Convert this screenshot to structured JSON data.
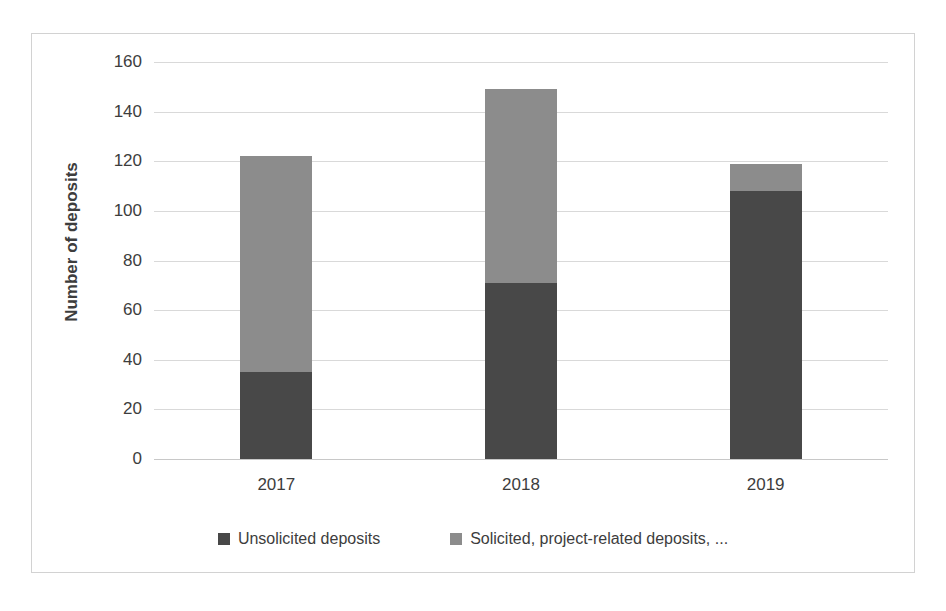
{
  "chart_data": {
    "type": "bar",
    "stacked": true,
    "title": "",
    "subtitle": "",
    "xlabel": "",
    "ylabel": "Number of deposits",
    "categories": [
      "2017",
      "2018",
      "2019"
    ],
    "series": [
      {
        "name": "Unsolicited deposits",
        "color": "#484848",
        "values": [
          35,
          71,
          108
        ]
      },
      {
        "name": "Solicited, project-related deposits, ...",
        "color": "#8c8c8c",
        "values": [
          87,
          78,
          11
        ]
      }
    ],
    "totals": [
      122,
      149,
      119
    ],
    "ylim": [
      0,
      160
    ],
    "ytick_labels": [
      "0",
      "20",
      "40",
      "60",
      "80",
      "100",
      "120",
      "140",
      "160"
    ],
    "ytick_values": [
      0,
      20,
      40,
      60,
      80,
      100,
      120,
      140,
      160
    ],
    "grid": true,
    "legend_position": "bottom",
    "plot_background": "#ffffff",
    "gridline_color": "#d9d9d9",
    "border_color": "#d2d2d2"
  }
}
